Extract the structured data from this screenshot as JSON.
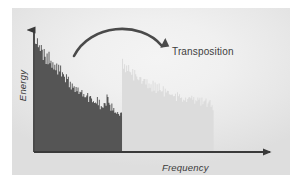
{
  "figure": {
    "annotation": "Transposition",
    "background_color": "#f0f0f0",
    "page_color": "#ffffff"
  },
  "chart_data": {
    "type": "area",
    "title": "",
    "subtitle": "",
    "xlabel": "Frequency",
    "ylabel": "Energy",
    "grid": false,
    "legend": null,
    "axes": {
      "x_arrow": true,
      "y_arrow": true,
      "x_range_label": "Frequency",
      "y_range_label": "Energy",
      "xlim": [
        0,
        1
      ],
      "ylim": [
        0,
        1
      ]
    },
    "annotations": [
      {
        "text": "Transposition",
        "type": "curved-arrow-label",
        "arrow": "arc from original spectrum to transposed spectrum",
        "arrow_start_x": 0.22,
        "arrow_end_x": 0.58,
        "color": "#404040"
      }
    ],
    "series": [
      {
        "name": "Original spectrum",
        "color": "#555555",
        "x_start": 0.0,
        "x_end": 0.38,
        "envelope_note": "high-frequency noisy spectrum decaying from left to right",
        "values": [
          0.98,
          0.93,
          0.96,
          0.89,
          0.94,
          0.86,
          0.91,
          0.88,
          0.83,
          0.9,
          0.85,
          0.8,
          0.86,
          0.79,
          0.84,
          0.77,
          0.82,
          0.75,
          0.8,
          0.74,
          0.78,
          0.72,
          0.76,
          0.7,
          0.74,
          0.68,
          0.72,
          0.66,
          0.7,
          0.64,
          0.68,
          0.62,
          0.66,
          0.6,
          0.64,
          0.58,
          0.62,
          0.57,
          0.6,
          0.55,
          0.58,
          0.54,
          0.57,
          0.52,
          0.55,
          0.51,
          0.54,
          0.5,
          0.52,
          0.49,
          0.51,
          0.48,
          0.5,
          0.47,
          0.49,
          0.46,
          0.48,
          0.45,
          0.47,
          0.44,
          0.46,
          0.43,
          0.45,
          0.42,
          0.44,
          0.41,
          0.43,
          0.4,
          0.42,
          0.4,
          0.41,
          0.39,
          0.4,
          0.38,
          0.46,
          0.44,
          0.42,
          0.4,
          0.39,
          0.38,
          0.37,
          0.36,
          0.36,
          0.35,
          0.35,
          0.34,
          0.34,
          0.33,
          0.33,
          0.32
        ]
      },
      {
        "name": "Transposed spectrum",
        "color": "#dcdcdc",
        "x_start": 0.38,
        "x_end": 0.78,
        "envelope_note": "same spectrum shifted upward in frequency",
        "values": [
          0.78,
          0.73,
          0.76,
          0.7,
          0.74,
          0.69,
          0.72,
          0.68,
          0.71,
          0.66,
          0.7,
          0.65,
          0.69,
          0.64,
          0.67,
          0.63,
          0.66,
          0.62,
          0.65,
          0.61,
          0.64,
          0.6,
          0.63,
          0.59,
          0.62,
          0.58,
          0.61,
          0.57,
          0.6,
          0.56,
          0.59,
          0.55,
          0.58,
          0.54,
          0.57,
          0.53,
          0.56,
          0.53,
          0.55,
          0.52,
          0.54,
          0.51,
          0.54,
          0.5,
          0.53,
          0.5,
          0.52,
          0.49,
          0.52,
          0.48,
          0.51,
          0.48,
          0.5,
          0.47,
          0.5,
          0.47,
          0.49,
          0.46,
          0.49,
          0.46,
          0.48,
          0.45,
          0.48,
          0.45,
          0.47,
          0.44,
          0.47,
          0.44,
          0.46,
          0.44,
          0.46,
          0.43,
          0.45,
          0.43,
          0.45,
          0.42,
          0.44,
          0.42,
          0.44,
          0.41,
          0.43,
          0.41,
          0.43,
          0.4,
          0.42,
          0.4,
          0.42,
          0.4,
          0.41,
          0.39
        ]
      }
    ]
  }
}
